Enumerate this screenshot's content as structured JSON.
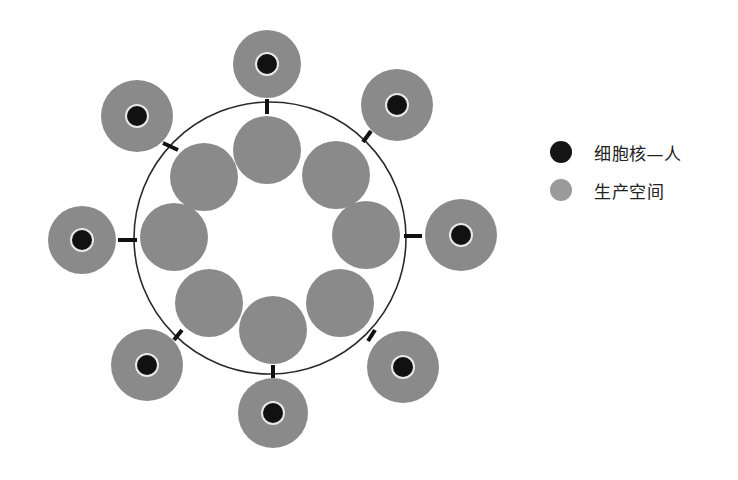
{
  "colors": {
    "space_fill": "#8a8a8a",
    "nucleus_fill": "#111111",
    "nucleus_ring": "#e8e8e8",
    "ring_stroke": "#2a2a2a",
    "connector": "#111111",
    "legend_nucleus": "#151515",
    "legend_space": "#9a9a9a"
  },
  "ring": {
    "cx": 270,
    "cy": 238,
    "r": 136
  },
  "inner_circles": [
    {
      "cx": 267,
      "cy": 150,
      "r": 34
    },
    {
      "cx": 336,
      "cy": 175,
      "r": 34
    },
    {
      "cx": 366,
      "cy": 235,
      "r": 34
    },
    {
      "cx": 340,
      "cy": 303,
      "r": 34
    },
    {
      "cx": 273,
      "cy": 330,
      "r": 34
    },
    {
      "cx": 209,
      "cy": 303,
      "r": 34
    },
    {
      "cx": 174,
      "cy": 237,
      "r": 34
    },
    {
      "cx": 204,
      "cy": 177,
      "r": 34
    }
  ],
  "outer_cells": [
    {
      "cx": 267,
      "cy": 64,
      "r": 34,
      "nr": 10
    },
    {
      "cx": 397,
      "cy": 105,
      "r": 36,
      "nr": 10
    },
    {
      "cx": 461,
      "cy": 235,
      "r": 36,
      "nr": 10
    },
    {
      "cx": 403,
      "cy": 367,
      "r": 36,
      "nr": 10
    },
    {
      "cx": 273,
      "cy": 413,
      "r": 35,
      "nr": 10
    },
    {
      "cx": 147,
      "cy": 365,
      "r": 36,
      "nr": 10
    },
    {
      "cx": 82,
      "cy": 240,
      "r": 34,
      "nr": 10
    },
    {
      "cx": 137,
      "cy": 116,
      "r": 36,
      "nr": 10
    }
  ],
  "connectors": [
    {
      "x1": 267,
      "y1": 99,
      "x2": 267,
      "y2": 114
    },
    {
      "x1": 371,
      "y1": 131,
      "x2": 363,
      "y2": 142
    },
    {
      "x1": 404,
      "y1": 236,
      "x2": 422,
      "y2": 236
    },
    {
      "x1": 375,
      "y1": 330,
      "x2": 368,
      "y2": 341
    },
    {
      "x1": 273,
      "y1": 365,
      "x2": 273,
      "y2": 378
    },
    {
      "x1": 182,
      "y1": 330,
      "x2": 174,
      "y2": 340
    },
    {
      "x1": 118,
      "y1": 240,
      "x2": 137,
      "y2": 240
    },
    {
      "x1": 163,
      "y1": 143,
      "x2": 178,
      "y2": 150
    }
  ],
  "legend": {
    "items": [
      {
        "label": "细胞核—人",
        "swatch": "nucleus"
      },
      {
        "label": "生产空间",
        "swatch": "space"
      }
    ]
  }
}
